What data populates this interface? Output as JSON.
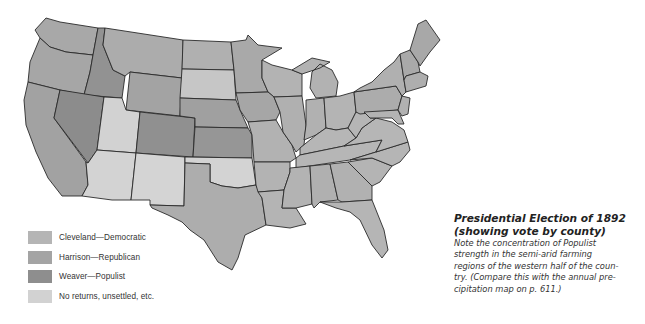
{
  "figure": {
    "title_line1": "Presidential Election of 1892",
    "title_line2": "(showing vote by county)",
    "body": "Note the concentration of Populist strength in the semi-arid farming regions of the western half of the country. (Compare this with the annual precipitation map on p. 611.)",
    "body_lines": [
      "Note the concentration of Populist",
      "strength in the semi-arid farming",
      "regions of the western half of the coun-",
      "try. (Compare this with the annual pre-",
      "cipitation map on p. 611.)"
    ]
  },
  "legend": {
    "items": [
      {
        "label": "Cleveland—Democratic",
        "color": "#b5b5b5"
      },
      {
        "label": "Harrison—Republican",
        "color": "#a4a4a4"
      },
      {
        "label": "Weaver—Populist",
        "color": "#8e8e8e"
      },
      {
        "label": "No returns, unsettled, etc.",
        "color": "#d2d2d2"
      }
    ]
  },
  "colors": {
    "democratic": "#b5b5b5",
    "republican": "#a4a4a4",
    "populist": "#8e8e8e",
    "no_returns": "#d2d2d2",
    "border": "#2a2a2a",
    "background": "#ffffff"
  }
}
